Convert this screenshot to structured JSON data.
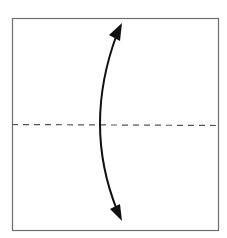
{
  "diagram": {
    "type": "origami-fold-instruction",
    "paper": {
      "shape": "square",
      "x": 12,
      "y": 18,
      "width": 207,
      "height": 213,
      "stroke": "#6e6e6e",
      "fill": "#ffffff"
    },
    "fold_line": {
      "style": "valley-dashed",
      "y": 125,
      "x1": 12,
      "x2": 219,
      "stroke": "#555555"
    },
    "arrow": {
      "style": "double-headed-curved",
      "from": [
        119,
        28
      ],
      "control": [
        82,
        125
      ],
      "to": [
        119,
        216
      ],
      "stroke": "#111111"
    },
    "colors": {
      "background": "#ffffff",
      "ink": "#111111"
    }
  }
}
